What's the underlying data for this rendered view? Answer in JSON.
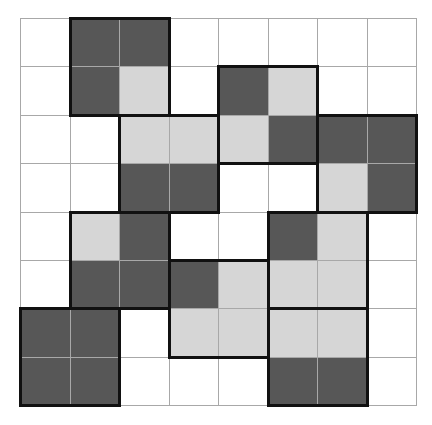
{
  "diagram": {
    "type": "grid-puzzle",
    "rows": 8,
    "cols": 8,
    "colors": {
      "empty": "#ffffff",
      "light": "#d6d6d6",
      "dark": "#575757",
      "grid_line": "#a8a8a8",
      "piece_border": "#111111"
    },
    "cells": [
      [
        "empty",
        "dark",
        "dark",
        "empty",
        "empty",
        "empty",
        "empty",
        "empty"
      ],
      [
        "empty",
        "dark",
        "light",
        "empty",
        "dark",
        "light",
        "empty",
        "empty"
      ],
      [
        "empty",
        "empty",
        "light",
        "light",
        "light",
        "dark",
        "dark",
        "dark"
      ],
      [
        "empty",
        "empty",
        "dark",
        "dark",
        "empty",
        "empty",
        "light",
        "dark"
      ],
      [
        "empty",
        "light",
        "dark",
        "empty",
        "empty",
        "dark",
        "light",
        "empty"
      ],
      [
        "empty",
        "dark",
        "dark",
        "dark",
        "light",
        "light",
        "light",
        "empty"
      ],
      [
        "dark",
        "dark",
        "empty",
        "light",
        "light",
        "light",
        "light",
        "empty"
      ],
      [
        "dark",
        "dark",
        "empty",
        "empty",
        "empty",
        "dark",
        "dark",
        "empty"
      ]
    ],
    "pieces": [
      {
        "id": "A",
        "row": 0,
        "col": 1,
        "h": 2,
        "w": 2
      },
      {
        "id": "B",
        "row": 1,
        "col": 4,
        "h": 2,
        "w": 2
      },
      {
        "id": "C",
        "row": 2,
        "col": 2,
        "h": 2,
        "w": 2
      },
      {
        "id": "D",
        "row": 2,
        "col": 6,
        "h": 2,
        "w": 2
      },
      {
        "id": "E",
        "row": 4,
        "col": 1,
        "h": 2,
        "w": 2
      },
      {
        "id": "F",
        "row": 4,
        "col": 5,
        "h": 2,
        "w": 2
      },
      {
        "id": "G",
        "row": 5,
        "col": 3,
        "h": 2,
        "w": 2
      },
      {
        "id": "H",
        "row": 6,
        "col": 0,
        "h": 2,
        "w": 2
      },
      {
        "id": "I",
        "row": 6,
        "col": 5,
        "h": 2,
        "w": 2
      }
    ]
  }
}
